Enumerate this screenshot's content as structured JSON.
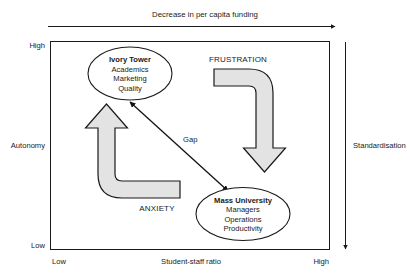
{
  "figure": {
    "type": "conceptual-quadrant-diagram",
    "top_axis": {
      "label": "Decrease in per capita funding",
      "direction": "right"
    },
    "left_axis": {
      "name": "Autonomy",
      "high_label": "High",
      "low_label": "Low"
    },
    "bottom_axis": {
      "name": "Student-staff ratio",
      "low_label": "Low",
      "high_label": "High"
    },
    "right_axis": {
      "name": "Standardisation",
      "direction": "down"
    },
    "nodes": [
      {
        "id": "ivory-tower",
        "title": "Ivory Tower",
        "items": [
          "Academics",
          "Marketing",
          "Quality"
        ]
      },
      {
        "id": "mass-university",
        "title": "Mass University",
        "items": [
          "Managers",
          "Operations",
          "Productivity"
        ]
      }
    ],
    "flows": [
      {
        "id": "frustration",
        "label": "FRUSTRATION",
        "direction": "down"
      },
      {
        "id": "anxiety",
        "label": "ANXIETY",
        "direction": "up"
      }
    ],
    "connector": {
      "id": "gap",
      "label": "Gap",
      "style": "double-headed-arrow"
    },
    "colors": {
      "ink": "#1a1a1a",
      "arrow_fill": "#e3e3e3",
      "background": "#ffffff"
    }
  }
}
